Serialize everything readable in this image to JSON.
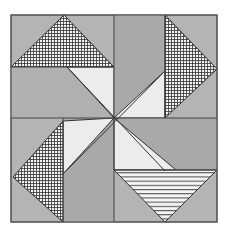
{
  "diagram": {
    "colors": {
      "background": "#ffffff",
      "gray": "#b4b4b4",
      "dark_gray": "#a6a6a6",
      "light": "#ececec",
      "line": "#3a3a3a"
    },
    "pieces": [
      {
        "name": "checkered-triangle-top",
        "fill": "crosshatch"
      },
      {
        "name": "checkered-triangle-right",
        "fill": "crosshatch"
      },
      {
        "name": "checkered-triangle-left",
        "fill": "crosshatch"
      },
      {
        "name": "striped-triangle-bottom",
        "fill": "horizontal-stripes"
      },
      {
        "name": "light-triangle-tl",
        "fill": "light"
      },
      {
        "name": "light-triangle-tr",
        "fill": "light"
      },
      {
        "name": "light-triangle-bl",
        "fill": "light"
      },
      {
        "name": "light-triangle-br",
        "fill": "light"
      }
    ]
  }
}
